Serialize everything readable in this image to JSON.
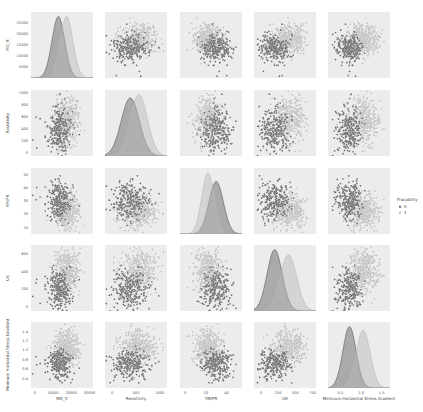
{
  "chart_data": {
    "type": "scatter",
    "title": "",
    "kind": "pairplot",
    "hue": "Fracability",
    "variables": [
      "MD_ft",
      "Resistivity",
      "YM/PR",
      "UCS",
      "Minimum Horizontal Stress Gradient"
    ],
    "axis_labels": [
      "MD_ft",
      "Resistivity",
      "YM/PR",
      "UK",
      "Minimum Horizontal Stress Gradient"
    ],
    "ticks": [
      {
        "values": [
          5000,
          10000,
          15000,
          20000,
          25000
        ],
        "labels": [
          "5000",
          "10000",
          "15000",
          "20000",
          "25000"
        ],
        "range": [
          0,
          30000
        ]
      },
      {
        "values": [
          0,
          200,
          400,
          600,
          800,
          1000
        ],
        "labels": [
          "0",
          "200",
          "400",
          "600",
          "800",
          "1000"
        ],
        "range": [
          -50,
          1050
        ]
      },
      {
        "values": [
          10,
          20,
          30,
          40,
          50
        ],
        "labels": [
          "10",
          "20",
          "30",
          "40",
          "50"
        ],
        "range": [
          5,
          55
        ]
      },
      {
        "values": [
          0,
          200,
          400,
          600
        ],
        "labels": [
          "0",
          "200",
          "400",
          "600"
        ],
        "range": [
          -50,
          700
        ]
      },
      {
        "values": [
          0.4,
          0.6,
          0.8,
          1.0,
          1.2,
          1.4
        ],
        "labels": [
          "0.4",
          "0.6",
          "0.8",
          "1.0",
          "1.2",
          "1.4"
        ],
        "range": [
          0.2,
          1.6
        ]
      }
    ],
    "bottom_ticks": [
      {
        "values": [
          0,
          10000,
          20000,
          30000
        ],
        "labels": [
          "0",
          "10000",
          "20000",
          "30000"
        ],
        "range": [
          -2000,
          32000
        ]
      },
      {
        "values": [
          0,
          500,
          1000
        ],
        "labels": [
          "0",
          "500",
          "1000"
        ],
        "range": [
          -150,
          1150
        ]
      },
      {
        "values": [
          0,
          20,
          40
        ],
        "labels": [
          "0",
          "20",
          "40"
        ],
        "range": [
          -5,
          55
        ]
      },
      {
        "values": [
          0,
          250,
          500,
          750
        ],
        "labels": [
          "0",
          "250",
          "500",
          "750"
        ],
        "range": [
          -100,
          800
        ]
      },
      {
        "values": [
          0.5,
          1.0,
          1.5
        ],
        "labels": [
          "0.5",
          "1.0",
          "1.5"
        ],
        "range": [
          0.2,
          1.7
        ]
      }
    ],
    "series": [
      {
        "name": "0",
        "color": "#5a5a5a",
        "means": [
          13000,
          380,
          30,
          200,
          0.72
        ],
        "sds": [
          3500,
          190,
          7,
          110,
          0.16
        ]
      },
      {
        "name": "1",
        "color": "#b8b8b8",
        "means": [
          17500,
          560,
          22,
          400,
          1.05
        ],
        "sds": [
          3500,
          180,
          6,
          120,
          0.17
        ]
      }
    ],
    "legend": {
      "title": "Fracability",
      "entries": [
        "0",
        "1"
      ],
      "position": "right"
    },
    "grid": false,
    "panel_background": "#ececec"
  }
}
